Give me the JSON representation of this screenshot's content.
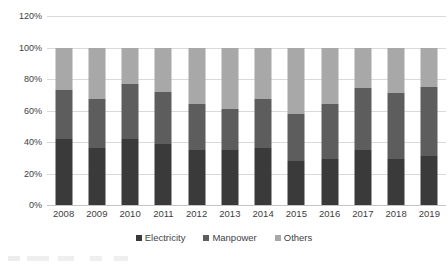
{
  "chart_data": {
    "type": "bar",
    "subtype": "stacked-percentage",
    "title": "",
    "subtitle": "",
    "xlabel": "",
    "ylabel": "",
    "categories": [
      "2008",
      "2009",
      "2010",
      "2011",
      "2012",
      "2013",
      "2014",
      "2015",
      "2016",
      "2017",
      "2018",
      "2019"
    ],
    "series": [
      {
        "name": "Electricity",
        "color": "#3a3a3a",
        "values": [
          42,
          36,
          42,
          39,
          35,
          35,
          36,
          28,
          29,
          35,
          29,
          31
        ]
      },
      {
        "name": "Manpower",
        "color": "#5d5d5d",
        "values": [
          31,
          31,
          35,
          33,
          29,
          26,
          31,
          30,
          35,
          39,
          42,
          44
        ]
      },
      {
        "name": "Others",
        "color": "#a8a8a8",
        "values": [
          27,
          33,
          23,
          28,
          36,
          39,
          33,
          42,
          36,
          26,
          29,
          25
        ]
      }
    ],
    "ylim": [
      0,
      120
    ],
    "y_ticks": [
      "0%",
      "20%",
      "40%",
      "60%",
      "80%",
      "100%",
      "120%"
    ],
    "y_tick_values": [
      0,
      20,
      40,
      60,
      80,
      100,
      120
    ],
    "grid": true,
    "grid_axis": "y",
    "legend_position": "bottom",
    "legend": [
      "Electricity",
      "Manpower",
      "Others"
    ]
  },
  "colors": {
    "electricity": "#3a3a3a",
    "manpower": "#5d5d5d",
    "others": "#a8a8a8",
    "gridline": "#d9d9d9",
    "text": "#404040",
    "background": "#ffffff"
  }
}
